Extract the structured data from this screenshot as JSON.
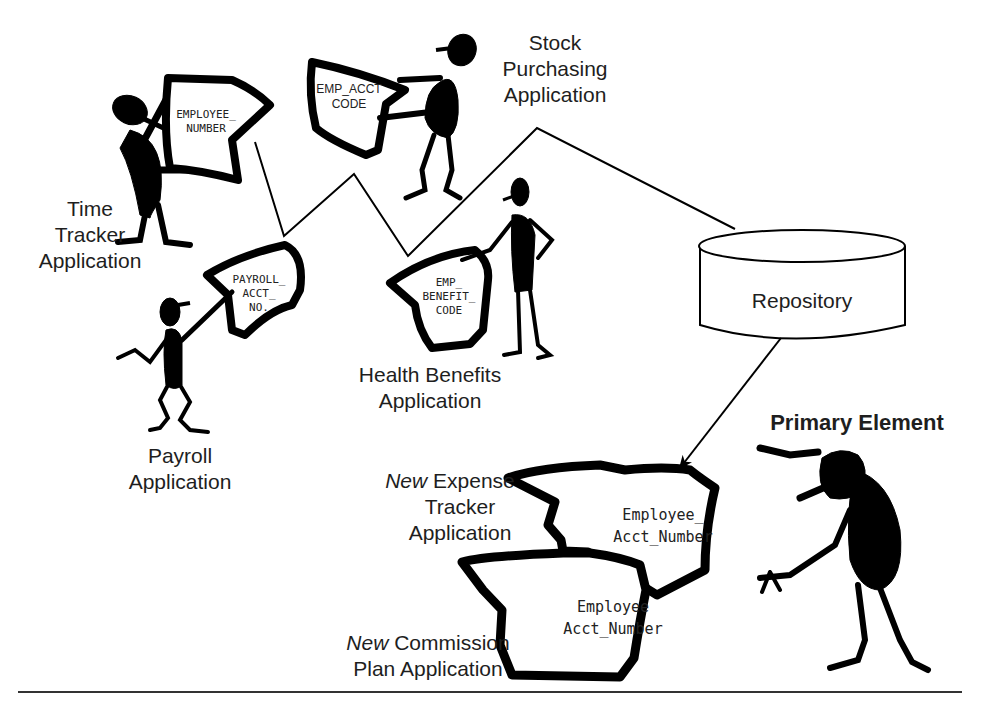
{
  "diagram": {
    "colors": {
      "ink": "#000000",
      "background": "#ffffff",
      "text": "#1e1e1e"
    },
    "applications": [
      {
        "id": "time-tracker",
        "label_lines": [
          "Time",
          "Tracker",
          "Application"
        ],
        "element_lines": [
          "EMPLOYEE_",
          "NUMBER"
        ]
      },
      {
        "id": "stock-purchasing",
        "label_lines": [
          "Stock",
          "Purchasing",
          "Application"
        ],
        "element_lines": [
          "EMP_ACCT",
          "CODE"
        ]
      },
      {
        "id": "payroll",
        "label_lines": [
          "Payroll",
          "Application"
        ],
        "element_lines": [
          "PAYROLL_",
          "ACCT_",
          "NO."
        ]
      },
      {
        "id": "health-benefits",
        "label_lines": [
          "Health Benefits",
          "Application"
        ],
        "element_lines": [
          "EMP_",
          "BENEFIT_",
          "CODE"
        ]
      },
      {
        "id": "expense-tracker",
        "label_prefix": "New",
        "label_lines": [
          "Expense",
          "Tracker",
          "Application"
        ],
        "element_lines": [
          "Employee_",
          "Acct_Number"
        ]
      },
      {
        "id": "commission-plan",
        "label_prefix": "New",
        "label_lines": [
          "Commission",
          "Plan Application"
        ],
        "element_lines": [
          "Employee",
          "Acct_Number"
        ]
      }
    ],
    "repository": {
      "label": "Repository"
    },
    "primary_element": {
      "label": "Primary Element"
    },
    "icons": [
      "stick-figure-icon",
      "element-card-icon",
      "database-cylinder-icon",
      "arrow-icon"
    ]
  }
}
